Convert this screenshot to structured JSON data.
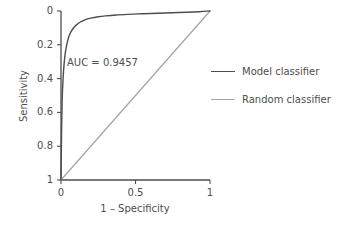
{
  "chart_data": {
    "type": "line",
    "title": "",
    "xlabel": "1 – Specificity",
    "ylabel": "Sensitivity",
    "xlim": [
      0,
      1
    ],
    "ylim": [
      0,
      1
    ],
    "grid": false,
    "xticks": [
      "0",
      "0.5",
      "1"
    ],
    "xtick_values": [
      0,
      0.5,
      1
    ],
    "yticks": [
      "0",
      "0.2",
      "0.4",
      "0.6",
      "0.8",
      "1"
    ],
    "ytick_values": [
      0,
      0.2,
      0.4,
      0.6,
      0.8,
      1
    ],
    "annotations": [
      {
        "text": "AUC = 0.9457",
        "x": 0.04,
        "y": 0.71
      }
    ],
    "legend_position": "right",
    "series": [
      {
        "name": "Model classifier",
        "color": "#4d4d4d",
        "x": [
          0,
          0.004,
          0.008,
          0.014,
          0.02,
          0.03,
          0.045,
          0.06,
          0.08,
          0.1,
          0.13,
          0.16,
          0.2,
          0.25,
          0.3,
          0.37,
          0.45,
          0.55,
          0.65,
          0.75,
          0.85,
          0.93,
          1
        ],
        "y": [
          0,
          0.3,
          0.48,
          0.6,
          0.68,
          0.76,
          0.825,
          0.865,
          0.895,
          0.915,
          0.935,
          0.948,
          0.958,
          0.966,
          0.971,
          0.976,
          0.98,
          0.984,
          0.987,
          0.99,
          0.993,
          0.996,
          1
        ]
      },
      {
        "name": "Random classifier",
        "color": "#a6a6a6",
        "x": [
          0,
          1
        ],
        "y": [
          0,
          1
        ]
      }
    ]
  },
  "axes": {
    "y_axis_name": "Sensitivity",
    "x_axis_name": "1 – Specificity"
  },
  "legend": {
    "items": [
      {
        "label": "Model classifier",
        "color": "#4d4d4d"
      },
      {
        "label": "Random classifier",
        "color": "#a6a6a6"
      }
    ]
  },
  "annotation": {
    "auc_text": "AUC = 0.9457"
  },
  "ticks": {
    "y": [
      "1",
      "0.8",
      "0.6",
      "0.4",
      "0.2",
      "0"
    ],
    "x": [
      "0",
      "0.5",
      "1"
    ]
  },
  "colors": {
    "axis": "#4d4d4d",
    "model": "#4d4d4d",
    "random": "#a6a6a6",
    "background": "#ffffff"
  }
}
